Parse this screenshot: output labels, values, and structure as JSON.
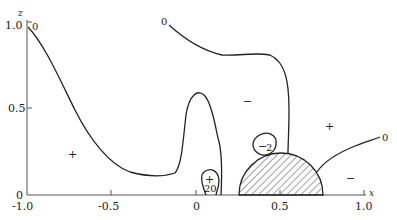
{
  "figure": {
    "x_axis": {
      "label": "x",
      "ticks": [
        "-1.0",
        "-0.5",
        "0",
        "0.5",
        "1.0"
      ]
    },
    "y_axis": {
      "label": "z",
      "ticks": [
        "0",
        "0.5",
        "1.0"
      ]
    },
    "contour_labels": {
      "top_left_zero": "0",
      "top_mid_zero": "0",
      "right_zero": "0",
      "small_loop_left": "20",
      "small_loop_right": "2"
    },
    "region_signs": {
      "left_plus": "+",
      "mid_minus": "−",
      "right_plus": "+",
      "right_low_minus": "−",
      "loop_left_plus": "+",
      "loop_right_minus": "−"
    },
    "obstacle": "hatched semicircle"
  }
}
